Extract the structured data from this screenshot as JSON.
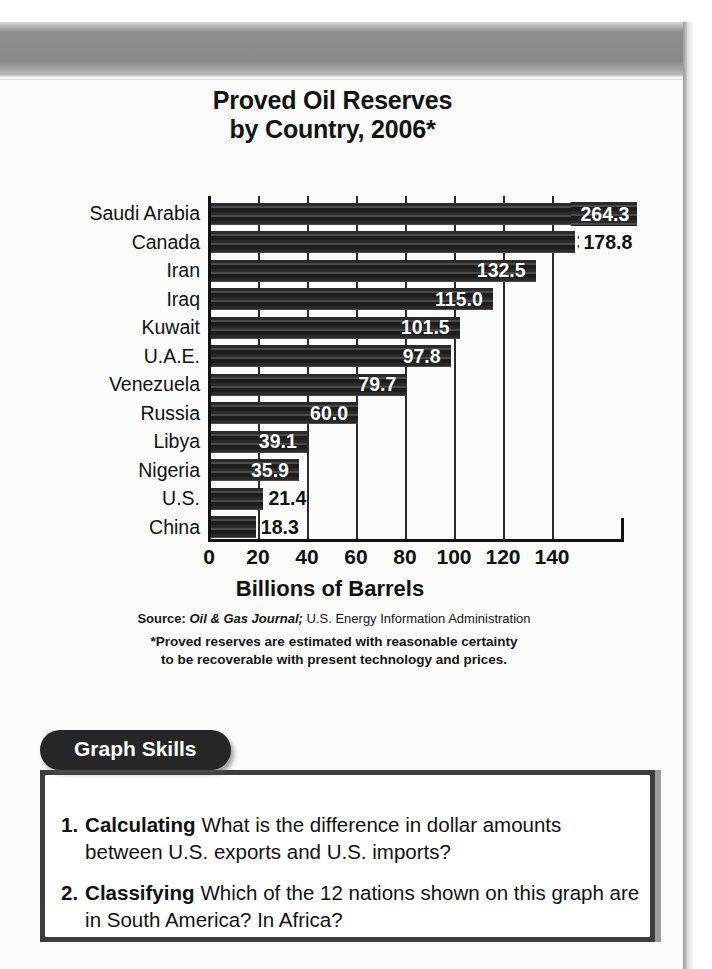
{
  "chart_data": {
    "type": "bar",
    "orientation": "horizontal",
    "title": "Proved Oil Reserves\nby Country, 2006*",
    "title_line1": "Proved Oil Reserves",
    "title_line2": "by Country, 2006*",
    "xlabel": "Billions of Barrels",
    "ylabel": "",
    "xlim": [
      0,
      140
    ],
    "axis_max_visible": 150,
    "grid": true,
    "legend": null,
    "tick_labels": [
      "0",
      "20",
      "40",
      "60",
      "80",
      "100",
      "120",
      "140"
    ],
    "tick_values": [
      0,
      20,
      40,
      60,
      80,
      100,
      120,
      140
    ],
    "categories": [
      "Saudi Arabia",
      "Canada",
      "Iran",
      "Iraq",
      "Kuwait",
      "U.A.E.",
      "Venezuela",
      "Russia",
      "Libya",
      "Nigeria",
      "U.S.",
      "China"
    ],
    "values": [
      264.3,
      178.8,
      132.5,
      115.0,
      101.5,
      97.8,
      79.7,
      60.0,
      39.1,
      35.9,
      21.4,
      18.3
    ],
    "value_labels": [
      "264.3",
      "178.8",
      "132.5",
      "115.0",
      "101.5",
      "97.8",
      "79.7",
      "60.0",
      "39.1",
      "35.9",
      "21.4",
      "18.3"
    ],
    "broken_bars": [
      "Saudi Arabia",
      "Canada"
    ],
    "bar_color": "#222222",
    "annotations": [
      "Bars for Saudi Arabia and Canada are truncated with a break symbol because the values exceed the axis range."
    ]
  },
  "chart": {
    "title_line1": "Proved Oil Reserves",
    "title_line2": "by Country, 2006*",
    "axis_title": "Billions of Barrels",
    "source_label": "Source:",
    "source_publication": "Oil & Gas Journal;",
    "source_agency": "U.S. Energy Information Administration",
    "footnote_line1": "*Proved reserves are estimated with reasonable certainty",
    "footnote_line2": "to be recoverable with present technology and prices.",
    "rows": [
      {
        "country": "Saudi Arabia",
        "label": "264.3",
        "value": 264.3,
        "broken": true,
        "label_mode": "broken-inside"
      },
      {
        "country": "Canada",
        "label": "178.8",
        "value": 178.8,
        "broken": true,
        "label_mode": "outside"
      },
      {
        "country": "Iran",
        "label": "132.5",
        "value": 132.5,
        "broken": false,
        "label_mode": "inside"
      },
      {
        "country": "Iraq",
        "label": "115.0",
        "value": 115.0,
        "broken": false,
        "label_mode": "inside"
      },
      {
        "country": "Kuwait",
        "label": "101.5",
        "value": 101.5,
        "broken": false,
        "label_mode": "inside"
      },
      {
        "country": "U.A.E.",
        "label": "97.8",
        "value": 97.8,
        "broken": false,
        "label_mode": "inside"
      },
      {
        "country": "Venezuela",
        "label": "79.7",
        "value": 79.7,
        "broken": false,
        "label_mode": "inside"
      },
      {
        "country": "Russia",
        "label": "60.0",
        "value": 60.0,
        "broken": false,
        "label_mode": "inside"
      },
      {
        "country": "Libya",
        "label": "39.1",
        "value": 39.1,
        "broken": false,
        "label_mode": "inside"
      },
      {
        "country": "Nigeria",
        "label": "35.9",
        "value": 35.9,
        "broken": false,
        "label_mode": "inside"
      },
      {
        "country": "U.S.",
        "label": "21.4",
        "value": 21.4,
        "broken": false,
        "label_mode": "outside"
      },
      {
        "country": "China",
        "label": "18.3",
        "value": 18.3,
        "broken": false,
        "label_mode": "outside"
      }
    ],
    "ticks": [
      "0",
      "20",
      "40",
      "60",
      "80",
      "100",
      "120",
      "140"
    ]
  },
  "skills": {
    "tab_label": "Graph Skills",
    "questions": [
      {
        "number": "1.",
        "skill": "Calculating",
        "text": "What is the difference in dollar amounts between U.S. exports and U.S. imports?"
      },
      {
        "number": "2.",
        "skill": "Classifying",
        "text": "Which of the 12 nations shown on this graph are in South America? In Africa?"
      }
    ]
  },
  "colors": {
    "bar": "#222222",
    "panel_border": "#3d3d3d",
    "tab_background": "#262626",
    "page_background": "#fbfbf9",
    "text": "#111111"
  }
}
